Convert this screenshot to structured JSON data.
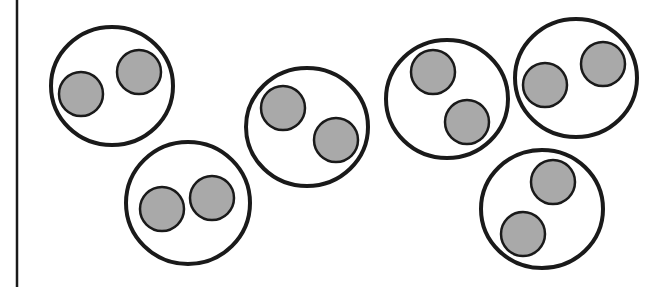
{
  "diagram": {
    "colors": {
      "background": "#ffffff",
      "outline": "#1a1a1a",
      "particle_fill": "#a9a9a9",
      "particle_stroke": "#1a1a1a"
    },
    "left_border": {
      "x": 17,
      "y1": 0,
      "y2": 287
    },
    "groups": [
      {
        "cx": 112,
        "cy": 86,
        "rx": 61,
        "ry": 59,
        "particles": [
          {
            "cx": 81,
            "cy": 94,
            "r": 22
          },
          {
            "cx": 139,
            "cy": 72,
            "r": 22
          }
        ]
      },
      {
        "cx": 188,
        "cy": 203,
        "rx": 62,
        "ry": 61,
        "particles": [
          {
            "cx": 162,
            "cy": 209,
            "r": 22
          },
          {
            "cx": 212,
            "cy": 198,
            "r": 22
          }
        ]
      },
      {
        "cx": 307,
        "cy": 127,
        "rx": 61,
        "ry": 59,
        "particles": [
          {
            "cx": 283,
            "cy": 108,
            "r": 22
          },
          {
            "cx": 336,
            "cy": 140,
            "r": 22
          }
        ]
      },
      {
        "cx": 447,
        "cy": 99,
        "rx": 61,
        "ry": 59,
        "particles": [
          {
            "cx": 433,
            "cy": 72,
            "r": 22
          },
          {
            "cx": 467,
            "cy": 122,
            "r": 22
          }
        ]
      },
      {
        "cx": 576,
        "cy": 78,
        "rx": 61,
        "ry": 59,
        "particles": [
          {
            "cx": 545,
            "cy": 85,
            "r": 22
          },
          {
            "cx": 603,
            "cy": 64,
            "r": 22
          }
        ]
      },
      {
        "cx": 542,
        "cy": 209,
        "rx": 61,
        "ry": 59,
        "particles": [
          {
            "cx": 523,
            "cy": 234,
            "r": 22
          },
          {
            "cx": 553,
            "cy": 182,
            "r": 22
          }
        ]
      }
    ]
  }
}
